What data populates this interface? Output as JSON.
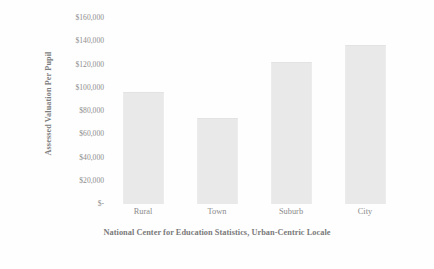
{
  "chart_data": {
    "type": "bar",
    "title": "",
    "subtitle": "",
    "xlabel": "National Center for Education Statistics, Urban-Centric Locale",
    "ylabel": "Assessed Valuation Per Pupil",
    "categories": [
      "Rural",
      "Town",
      "Suburb",
      "City"
    ],
    "values": [
      96000,
      74000,
      122000,
      137000
    ],
    "series": [
      {
        "name": "Assessed Valuation Per Pupil",
        "values": [
          96000,
          74000,
          122000,
          137000
        ],
        "color": "#e9e9e9"
      }
    ],
    "ylim": [
      0,
      160000
    ],
    "ytick_values": [
      0,
      20000,
      40000,
      60000,
      80000,
      100000,
      120000,
      140000,
      160000
    ],
    "ytick_labels": [
      "$-",
      "$20,000",
      "$40,000",
      "$60,000",
      "$80,000",
      "$100,000",
      "$120,000",
      "$140,000",
      "$160,000"
    ],
    "grid": false,
    "legend": false,
    "legend_position": "none",
    "bar_color": "#e9e9e9",
    "text_color": "#8a8a8a",
    "background": "#ffffff"
  }
}
